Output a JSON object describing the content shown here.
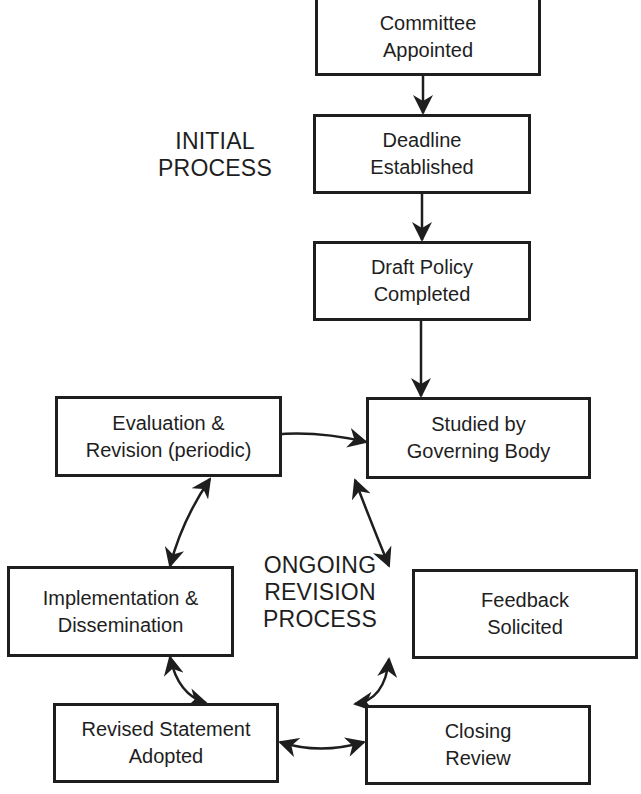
{
  "diagram": {
    "section_labels": {
      "initial": [
        "INITIAL",
        "PROCESS"
      ],
      "ongoing": [
        "ONGOING",
        "REVISION",
        "PROCESS"
      ]
    },
    "nodes": {
      "committee": [
        "Committee",
        "Appointed"
      ],
      "deadline": [
        "Deadline",
        "Established"
      ],
      "draft": [
        "Draft Policy",
        "Completed"
      ],
      "studied": [
        "Studied by",
        "Governing Body"
      ],
      "evaluation": [
        "Evaluation &",
        "Revision (periodic)"
      ],
      "implementation": [
        "Implementation &",
        "Dissemination"
      ],
      "feedback": [
        "Feedback",
        "Solicited"
      ],
      "revised": [
        "Revised Statement",
        "Adopted"
      ],
      "closing": [
        "Closing",
        "Review"
      ]
    },
    "edges": [
      {
        "from": "committee",
        "to": "deadline",
        "type": "one-way"
      },
      {
        "from": "deadline",
        "to": "draft",
        "type": "one-way"
      },
      {
        "from": "draft",
        "to": "studied",
        "type": "one-way"
      },
      {
        "from": "studied",
        "to": "feedback",
        "type": "two-way"
      },
      {
        "from": "feedback",
        "to": "closing",
        "type": "two-way"
      },
      {
        "from": "closing",
        "to": "revised",
        "type": "two-way"
      },
      {
        "from": "revised",
        "to": "implementation",
        "type": "two-way"
      },
      {
        "from": "implementation",
        "to": "evaluation",
        "type": "two-way"
      },
      {
        "from": "evaluation",
        "to": "studied",
        "type": "two-way"
      }
    ],
    "colors": {
      "stroke": "#1e1e1e",
      "background": "#ffffff"
    }
  }
}
